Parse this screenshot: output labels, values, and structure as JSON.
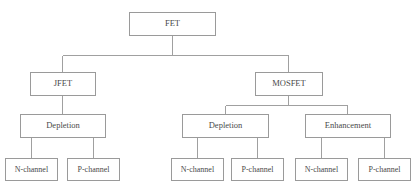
{
  "diagram": {
    "type": "hierarchy-tree",
    "colors": {
      "background": "#ffffff",
      "box_border": "#9a9a9a",
      "connector": "#a0a0a0",
      "text": "#4a4a4a"
    },
    "nodes": {
      "root": {
        "label": "FET"
      },
      "jfet": {
        "label": "JFET"
      },
      "mosfet": {
        "label": "MOSFET"
      },
      "jfet_depletion": {
        "label": "Depletion"
      },
      "mosfet_depletion": {
        "label": "Depletion"
      },
      "mosfet_enhancement": {
        "label": "Enhancement"
      },
      "jfet_dep_n": {
        "label": "N-channel"
      },
      "jfet_dep_p": {
        "label": "P-channel"
      },
      "mos_dep_n": {
        "label": "N-channel"
      },
      "mos_dep_p": {
        "label": "P-channel"
      },
      "mos_enh_n": {
        "label": "N-channel"
      },
      "mos_enh_p": {
        "label": "P-channel"
      }
    },
    "edges": [
      {
        "from": "root",
        "to": "jfet"
      },
      {
        "from": "root",
        "to": "mosfet"
      },
      {
        "from": "jfet",
        "to": "jfet_depletion"
      },
      {
        "from": "mosfet",
        "to": "mosfet_depletion"
      },
      {
        "from": "mosfet",
        "to": "mosfet_enhancement"
      },
      {
        "from": "jfet_depletion",
        "to": "jfet_dep_n"
      },
      {
        "from": "jfet_depletion",
        "to": "jfet_dep_p"
      },
      {
        "from": "mosfet_depletion",
        "to": "mos_dep_n"
      },
      {
        "from": "mosfet_depletion",
        "to": "mos_dep_p"
      },
      {
        "from": "mosfet_enhancement",
        "to": "mos_enh_n"
      },
      {
        "from": "mosfet_enhancement",
        "to": "mos_enh_p"
      }
    ]
  }
}
